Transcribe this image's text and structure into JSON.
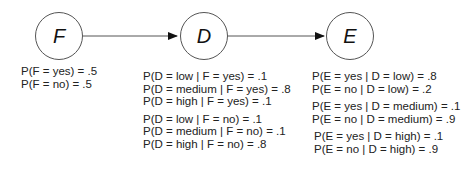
{
  "nodes": {
    "F": {
      "label": "F"
    },
    "D": {
      "label": "D"
    },
    "E": {
      "label": "E"
    }
  },
  "edges": [
    {
      "from": "F",
      "to": "D"
    },
    {
      "from": "D",
      "to": "E"
    }
  ],
  "cpt": {
    "F": [
      "P(F = yes) = .5",
      "P(F = no) = .5"
    ],
    "D_given_F_yes": [
      "P(D = low | F = yes) = .1",
      "P(D = medium | F = yes) = .8",
      "P(D = high | F = yes) = .1"
    ],
    "D_given_F_no": [
      "P(D = low | F = no) = .1",
      "P(D = medium | F = no) = .1",
      "P(D = high | F = no) = .8"
    ],
    "E_given_D_low": [
      "P(E = yes | D = low) = .8",
      "P(E = no | D = low) = .2"
    ],
    "E_given_D_medium": [
      "P(E = yes | D = medium) = .1",
      "P(E = no | D = medium) = .9"
    ],
    "E_given_D_high": [
      "P(E = yes | D = high) = .1",
      "P(E = no | D = high) = .9"
    ]
  }
}
